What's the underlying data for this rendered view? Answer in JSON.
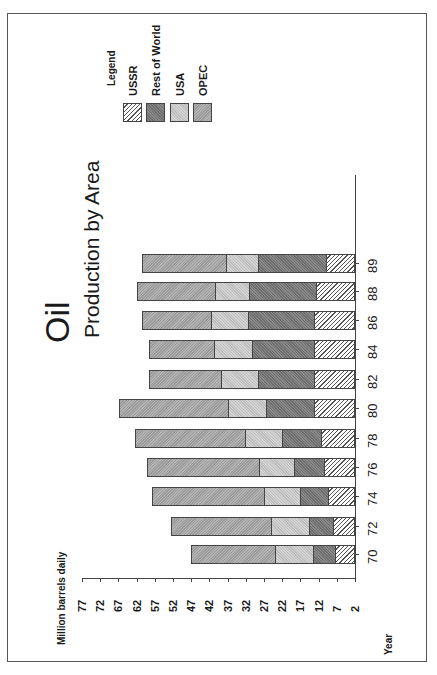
{
  "chart_data": {
    "type": "bar",
    "stacked": true,
    "orientation": "rotated-90-ccw",
    "title": "Oil",
    "subtitle": "Production by Area",
    "xlabel": "Year",
    "ylabel": "Million barrels daily",
    "ylim": [
      2,
      77
    ],
    "yticks": [
      77,
      72,
      67,
      62,
      57,
      52,
      47,
      42,
      37,
      32,
      27,
      22,
      17,
      12,
      7,
      2
    ],
    "categories": [
      "70",
      "72",
      "74",
      "76",
      "78",
      "80",
      "82",
      "84",
      "86",
      "88",
      "89"
    ],
    "legend_title": "Legend",
    "legend_position": "top-right",
    "grid": false,
    "series": [
      {
        "name": "USSR",
        "pattern": "diagonal-hatch",
        "cumulative_top": [
          6.9,
          7.5,
          8.9,
          10.0,
          10.8,
          12.7,
          12.7,
          12.7,
          12.7,
          12.2,
          9.4
        ]
      },
      {
        "name": "Rest of World",
        "pattern": "dark-gray",
        "cumulative_top": [
          13.0,
          14.1,
          16.6,
          18.5,
          21.8,
          26.2,
          28.4,
          30.0,
          31.1,
          30.8,
          28.4
        ]
      },
      {
        "name": "USA",
        "pattern": "light-gray",
        "cumulative_top": [
          23.7,
          24.8,
          26.7,
          28.1,
          32.0,
          36.6,
          38.5,
          40.5,
          41.3,
          40.2,
          37.2
        ]
      },
      {
        "name": "OPEC",
        "pattern": "medium-gray",
        "cumulative_top": [
          47.1,
          52.5,
          57.8,
          59.1,
          62.4,
          66.8,
          58.6,
          58.6,
          60.5,
          61.9,
          60.5
        ]
      }
    ],
    "segment_values": {
      "USSR": [
        4.9,
        5.5,
        6.9,
        8.0,
        8.8,
        10.7,
        10.7,
        10.7,
        10.7,
        10.2,
        7.4
      ],
      "Rest of World": [
        6.1,
        6.6,
        7.7,
        8.5,
        11.0,
        13.5,
        15.7,
        17.3,
        18.4,
        18.6,
        19.0
      ],
      "USA": [
        10.7,
        10.7,
        10.1,
        9.6,
        10.2,
        10.4,
        10.1,
        10.5,
        10.2,
        9.4,
        8.8
      ],
      "OPEC": [
        23.4,
        27.7,
        31.1,
        31.0,
        30.4,
        30.2,
        20.1,
        18.1,
        19.2,
        21.7,
        23.3
      ]
    }
  },
  "labels": {
    "title": "Oil",
    "subtitle": "Production by Area",
    "ylabel": "Million barrels daily",
    "xlabel": "Year",
    "legend_title": "Legend",
    "legend": [
      "USSR",
      "Rest of World",
      "USA",
      "OPEC"
    ]
  },
  "ticks": [
    "77",
    "72",
    "67",
    "62",
    "57",
    "52",
    "47",
    "42",
    "37",
    "32",
    "27",
    "22",
    "17",
    "12",
    "7",
    "2"
  ],
  "years": [
    "70",
    "72",
    "74",
    "76",
    "78",
    "80",
    "82",
    "84",
    "86",
    "88",
    "89"
  ]
}
